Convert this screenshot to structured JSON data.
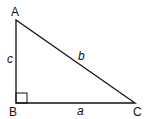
{
  "diagram": {
    "type": "right-triangle",
    "vertices": [
      {
        "id": "A",
        "label": "A"
      },
      {
        "id": "B",
        "label": "B"
      },
      {
        "id": "C",
        "label": "C"
      }
    ],
    "sides": [
      {
        "id": "a",
        "label": "a",
        "between": "B-C"
      },
      {
        "id": "b",
        "label": "b",
        "between": "A-C"
      },
      {
        "id": "c",
        "label": "c",
        "between": "A-B"
      }
    ],
    "right_angle_at": "B",
    "stroke_color": "#111111"
  }
}
